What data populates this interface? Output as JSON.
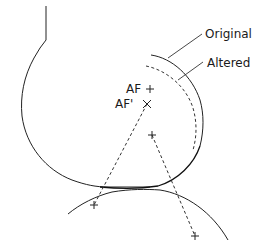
{
  "diagram": {
    "labels": {
      "original": "Original",
      "altered": "Altered",
      "af": "AF",
      "af_prime": "AF'"
    },
    "markers": {
      "af_center": "+",
      "af_prime_center": "×",
      "upper_arc_center": "+",
      "lower_left_point": "+",
      "lower_right_point": "+"
    },
    "colors": {
      "line": "#222222",
      "background": "#ffffff"
    }
  }
}
